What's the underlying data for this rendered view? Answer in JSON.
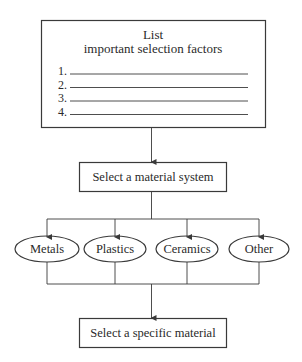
{
  "factors_box": {
    "title_line1": "List",
    "title_line2": "important selection factors",
    "items": [
      {
        "number": "1."
      },
      {
        "number": "2."
      },
      {
        "number": "3."
      },
      {
        "number": "4."
      }
    ]
  },
  "system_box": {
    "label": "Select a material system"
  },
  "material_systems": [
    {
      "label": "Metals"
    },
    {
      "label": "Plastics"
    },
    {
      "label": "Ceramics"
    },
    {
      "label": "Other"
    }
  ],
  "specific_box": {
    "label": "Select a specific material"
  },
  "colors": {
    "stroke": "#3a3a3a",
    "text": "#2a2a2a",
    "background": "#ffffff"
  }
}
